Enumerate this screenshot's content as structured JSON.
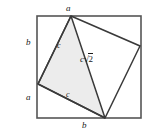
{
  "figure": {
    "panel_tag": "(a)",
    "outer_square": {
      "x": 37,
      "y": 16,
      "width": 104,
      "height": 102,
      "stroke": "#555555",
      "fill": "#ffffff"
    },
    "inner_square": {
      "vertices": [
        {
          "name": "top",
          "x": 71,
          "y": 16
        },
        {
          "name": "right",
          "x": 140,
          "y": 46
        },
        {
          "name": "bottom",
          "x": 105,
          "y": 118
        },
        {
          "name": "left",
          "x": 38,
          "y": 84
        }
      ],
      "stroke": "#3a3a3a",
      "fill": "none"
    },
    "shaded_triangle": {
      "vertices": [
        {
          "x": 71,
          "y": 16
        },
        {
          "x": 105,
          "y": 118
        },
        {
          "x": 38,
          "y": 84
        }
      ],
      "fill": "#ececec",
      "stroke": "#3a3a3a"
    },
    "diagonal": {
      "from": {
        "x": 71,
        "y": 16
      },
      "to": {
        "x": 105,
        "y": 118
      },
      "stroke": "#3a3a3a"
    },
    "labels": {
      "top_side": "a",
      "left_upper_side": "b",
      "left_lower_side": "a",
      "bottom_side": "b",
      "leg_upper": "c",
      "leg_lower": "c",
      "hypotenuse_coefficient": "c",
      "hypotenuse_radical": "√",
      "hypotenuse_radicand": "2"
    }
  }
}
